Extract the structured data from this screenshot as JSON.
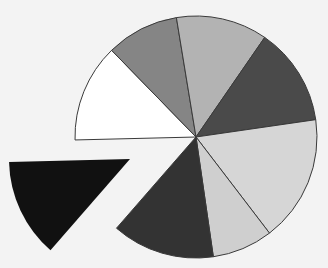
{
  "chart_data": {
    "type": "pie",
    "title": "",
    "legend": [],
    "center": [
      196,
      137
    ],
    "radius": 121,
    "start_angle_deg": 178.6,
    "stroke": "#3a3a3a",
    "background": "#f3f3f3",
    "slices": [
      {
        "label": "",
        "value": 13.1,
        "color": "#ffffff",
        "exploded": false
      },
      {
        "label": "",
        "value": 9.7,
        "color": "#858585",
        "exploded": false
      },
      {
        "label": "",
        "value": 12.2,
        "color": "#b3b3b3",
        "exploded": false
      },
      {
        "label": "",
        "value": 13.1,
        "color": "#4a4a4a",
        "exploded": false
      },
      {
        "label": "",
        "value": 16.9,
        "color": "#d6d6d6",
        "exploded": false
      },
      {
        "label": "",
        "value": 8.1,
        "color": "#cfcfcf",
        "exploded": false
      },
      {
        "label": "",
        "value": 13.7,
        "color": "#333333",
        "exploded": false
      },
      {
        "label": "",
        "value": 13.2,
        "color": "#111111",
        "exploded": true,
        "offset": [
          -66,
          22
        ]
      }
    ]
  }
}
